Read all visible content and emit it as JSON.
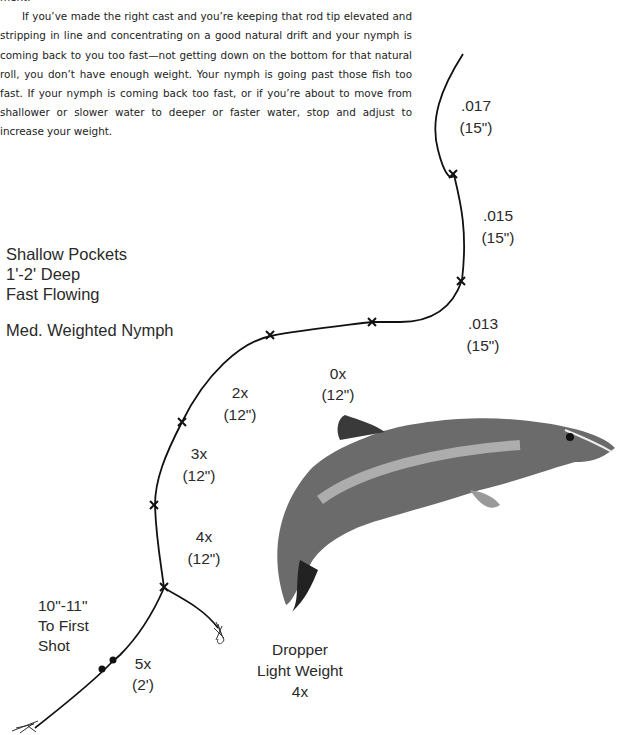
{
  "document": {
    "fragment_top": "ment.",
    "paragraph": "If you’ve made the right cast and you’re keeping that rod tip elevated and stripping in line and concentrating on a good natural drift and your nymph is coming back to you too fast—not getting down on the bottom for that natural roll, you don’t have enough weight. Your nymph is going past those fish too fast. If your nymph is coming back too fast, or if you’re about to move from shallower or slower water to deeper or faster water, stop and adjust to increase your weight."
  },
  "diagram": {
    "conditions": {
      "line1": "Shallow Pockets",
      "line2": "1'-2' Deep",
      "line3": "Fast Flowing",
      "rig": "Med. Weighted Nymph"
    },
    "leader_sections": [
      {
        "size": ".017",
        "length": "(15\")"
      },
      {
        "size": ".015",
        "length": "(15\")"
      },
      {
        "size": ".013",
        "length": "(15\")"
      },
      {
        "size": "0x",
        "length": "(12\")"
      },
      {
        "size": "2x",
        "length": "(12\")"
      },
      {
        "size": "3x",
        "length": "(12\")"
      },
      {
        "size": "4x",
        "length": "(12\")"
      },
      {
        "size": "5x",
        "length": "(2')"
      }
    ],
    "shot_note": {
      "line1": "10\"-11\"",
      "line2": "To First",
      "line3": "Shot"
    },
    "dropper": {
      "line1": "Dropper",
      "line2": "Light Weight",
      "line3": "4x"
    },
    "colors": {
      "ink": "#111111",
      "text": "#2a2a2a"
    }
  }
}
